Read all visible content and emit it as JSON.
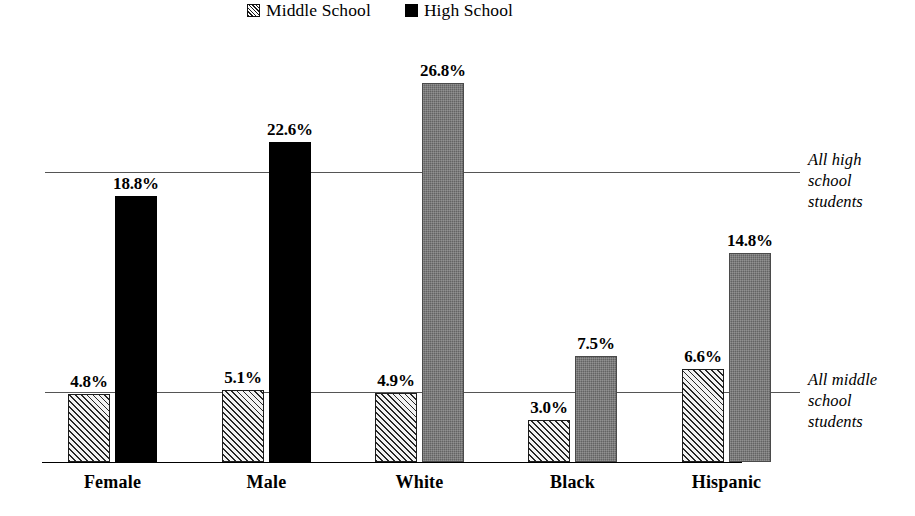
{
  "legend": {
    "items": [
      {
        "label": "Middle School",
        "swatch": "hatched-swatch",
        "color": "#d8d8d8"
      },
      {
        "label": "High School",
        "swatch": "solid-black-swatch",
        "color": "#000000"
      }
    ]
  },
  "annotations": {
    "high": "All high\nschool\nstudents",
    "middle": "All middle\nschool\nstudents"
  },
  "chart_data": {
    "type": "bar",
    "title": "",
    "xlabel": "",
    "ylabel": "",
    "ylim": [
      0,
      28
    ],
    "grid": false,
    "legend_position": "top-center",
    "categories": [
      "Female",
      "Male",
      "White",
      "Black",
      "Hispanic"
    ],
    "series": [
      {
        "name": "Middle School",
        "values": [
          4.8,
          5.1,
          4.9,
          3.0,
          6.6
        ],
        "labels": [
          "4.8%",
          "5.1%",
          "4.9%",
          "3.0%",
          "6.6%"
        ],
        "style": "hatched",
        "color": "#d8d8d8"
      },
      {
        "name": "High School",
        "values": [
          18.8,
          22.6,
          26.8,
          7.5,
          14.8
        ],
        "labels": [
          "18.8%",
          "22.6%",
          "26.8%",
          "7.5%",
          "14.8%"
        ],
        "style": "solid",
        "colors": [
          "#000000",
          "#000000",
          "#636363",
          "#636363",
          "#636363"
        ]
      }
    ],
    "reference_lines": [
      {
        "name": "All high school students",
        "value": 20.5,
        "label": "All high\nschool\nstudents"
      },
      {
        "name": "All middle school students",
        "value": 4.95,
        "label": "All middle\nschool\nstudents"
      }
    ]
  }
}
